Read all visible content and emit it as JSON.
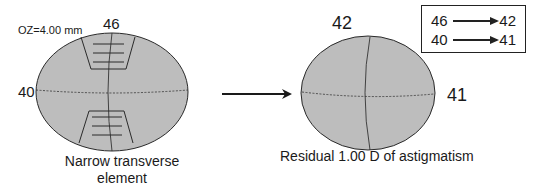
{
  "left_figure": {
    "optical_zone_label": "OZ=4.00 mm",
    "vertical_meridian_value": "46",
    "horizontal_meridian_value": "40",
    "caption_line1": "Narrow transverse",
    "caption_line2": "element"
  },
  "right_figure": {
    "vertical_meridian_value": "42",
    "horizontal_meridian_value": "41",
    "caption": "Residual 1.00 D of astigmatism"
  },
  "legend": {
    "rows": [
      {
        "from": "46",
        "to": "42"
      },
      {
        "from": "40",
        "to": "41"
      }
    ]
  },
  "colors": {
    "ellipse_fill": "#bdbdbd",
    "stroke": "#2a2a2a",
    "background": "#ffffff"
  }
}
